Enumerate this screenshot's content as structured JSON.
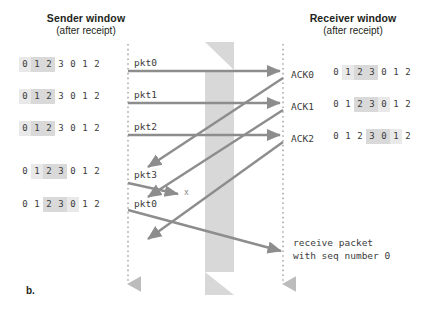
{
  "figure": {
    "label": "b.",
    "colors": {
      "arrow": "#8d8d8d",
      "timeline": "#bcbcbc",
      "band": "#d8d8d8",
      "cell_light": "#e9e9e9",
      "cell_dark": "#d9d9d9",
      "text": "#3b3b3b"
    }
  },
  "sender": {
    "title": "Sender window",
    "subtitle": "(after receipt)",
    "windows": [
      {
        "cells": [
          "0",
          "1",
          "2",
          "3",
          "0",
          "1",
          "2"
        ],
        "shade": [
          "light",
          "dark",
          "dark",
          "none",
          "none",
          "none",
          "none"
        ]
      },
      {
        "cells": [
          "0",
          "1",
          "2",
          "3",
          "0",
          "1",
          "2"
        ],
        "shade": [
          "light",
          "dark",
          "dark",
          "none",
          "none",
          "none",
          "none"
        ]
      },
      {
        "cells": [
          "0",
          "1",
          "2",
          "3",
          "0",
          "1",
          "2"
        ],
        "shade": [
          "light",
          "dark",
          "dark",
          "none",
          "none",
          "none",
          "none"
        ]
      },
      {
        "cells": [
          "0",
          "1",
          "2",
          "3",
          "0",
          "1",
          "2"
        ],
        "shade": [
          "none",
          "light",
          "dark",
          "dark",
          "none",
          "none",
          "none"
        ]
      },
      {
        "cells": [
          "0",
          "1",
          "2",
          "3",
          "0",
          "1",
          "2"
        ],
        "shade": [
          "none",
          "none",
          "dark",
          "dark",
          "light",
          "none",
          "none"
        ]
      }
    ]
  },
  "receiver": {
    "title": "Receiver window",
    "subtitle": "(after receipt)",
    "rows": [
      {
        "ack": "ACK0",
        "cells": [
          "0",
          "1",
          "2",
          "3",
          "0",
          "1",
          "2"
        ],
        "shade": [
          "none",
          "light",
          "dark",
          "dark",
          "none",
          "none",
          "none"
        ]
      },
      {
        "ack": "ACK1",
        "cells": [
          "0",
          "1",
          "2",
          "3",
          "0",
          "1",
          "2"
        ],
        "shade": [
          "none",
          "none",
          "dark",
          "dark",
          "light",
          "none",
          "none"
        ]
      },
      {
        "ack": "ACK2",
        "cells": [
          "0",
          "1",
          "2",
          "3",
          "0",
          "1",
          "2"
        ],
        "shade": [
          "none",
          "none",
          "none",
          "dark",
          "dark",
          "light",
          "none"
        ]
      }
    ]
  },
  "packets": [
    {
      "label": "pkt0"
    },
    {
      "label": "pkt1"
    },
    {
      "label": "pkt2"
    },
    {
      "label": "pkt3"
    },
    {
      "label": "pkt0"
    }
  ],
  "loss_marker": "x",
  "note": {
    "line1": "receive packet",
    "line2": "with seq number 0"
  },
  "chart_data": {
    "type": "diagram",
    "sender_timeline_x": 128,
    "receiver_timeline_x": 283,
    "events": [
      {
        "name": "pkt0",
        "direction": "sender-to-receiver",
        "kind": "horizontal",
        "delivered": true
      },
      {
        "name": "ACK0",
        "direction": "receiver-to-sender",
        "kind": "diagonal",
        "delivered": true
      },
      {
        "name": "pkt1",
        "direction": "sender-to-receiver",
        "kind": "horizontal",
        "delivered": true
      },
      {
        "name": "ACK1",
        "direction": "receiver-to-sender",
        "kind": "diagonal",
        "delivered": true
      },
      {
        "name": "pkt2",
        "direction": "sender-to-receiver",
        "kind": "horizontal",
        "delivered": true
      },
      {
        "name": "ACK2",
        "direction": "receiver-to-sender",
        "kind": "diagonal",
        "delivered": true
      },
      {
        "name": "pkt3",
        "direction": "sender-to-receiver",
        "kind": "lost",
        "delivered": false
      },
      {
        "name": "pkt0",
        "direction": "sender-to-receiver",
        "kind": "diagonal",
        "delivered": true
      }
    ]
  }
}
